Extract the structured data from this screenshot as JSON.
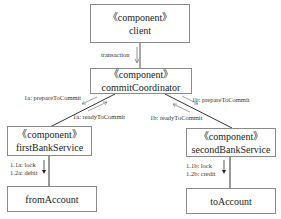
{
  "diagram": {
    "type": "UML communication diagram",
    "components": [
      {
        "id": "client",
        "stereotype": "《component》",
        "name": "client"
      },
      {
        "id": "commitCoordinator",
        "stereotype": "《component》",
        "name": "commitCoordinator"
      },
      {
        "id": "firstBankService",
        "stereotype": "《component》",
        "name": "firstBankService"
      },
      {
        "id": "secondBankService",
        "stereotype": "《component》",
        "name": "secondBankService"
      },
      {
        "id": "fromAccount",
        "name": "fromAccount"
      },
      {
        "id": "toAccount",
        "name": "toAccount"
      }
    ],
    "messages": {
      "transaction": "transaction",
      "m1a_prepare": "1a: prepareToCommit",
      "m1a_ready": "1a: readyToCommit",
      "m1b_prepare": "1b: prepareToCommit",
      "m1b_ready": "1b: readyToCommit",
      "m11a_lock": "1.1a: lock",
      "m12a_debit": "1.2a: debit",
      "m11b_lock": "1.1b: lock",
      "m12b_credit": "1.2b: credit"
    }
  }
}
